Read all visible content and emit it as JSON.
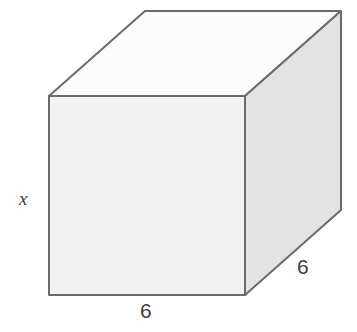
{
  "figure": {
    "name": "cube-net-diagram",
    "background_color": "#ffffff"
  },
  "solid": {
    "shape_name": "cube",
    "face_colors": {
      "front": "#f2f2f2",
      "top": "#fcfcfc",
      "right": "#e3e3e3"
    },
    "edge_color": "#6b6b6b",
    "edge_width": 2,
    "vertices": {
      "front_top_left": [
        49,
        96
      ],
      "front_top_right": [
        245,
        96
      ],
      "front_bottom_right": [
        245,
        295
      ],
      "front_bottom_left": [
        49,
        295
      ],
      "back_top_left": [
        145,
        11
      ],
      "back_top_right": [
        341,
        11
      ],
      "back_bottom_right": [
        341,
        210
      ]
    },
    "polygons": {
      "front_face": "49,96 245,96 245,295 49,295",
      "top_face": "49,96 145,11 341,11 245,96",
      "right_face": "245,96 341,11 341,210 245,295"
    }
  },
  "labels": {
    "height": {
      "text": "x",
      "meaning": "vertical edge length",
      "color": "#3d3d3d",
      "style": "italic"
    },
    "width": {
      "text": "6",
      "meaning": "bottom front edge length",
      "color": "#3d3d3d",
      "style": "normal"
    },
    "depth": {
      "text": "6",
      "meaning": "depth edge length",
      "color": "#3d3d3d",
      "style": "normal"
    }
  }
}
